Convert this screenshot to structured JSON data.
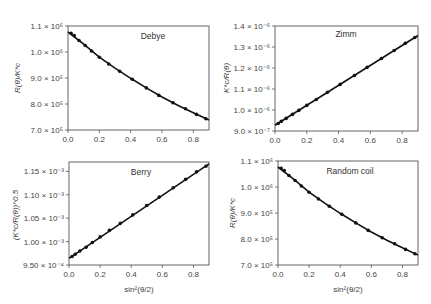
{
  "figure": {
    "shared_xlabel": "sin²(θ/2)"
  },
  "chart_data": [
    {
      "type": "line",
      "title": "Debye",
      "xlabel": "",
      "ylabel": "R(θ)/K*c",
      "xlim": [
        0.0,
        0.9
      ],
      "ylim": [
        700000,
        1100000
      ],
      "xticks": [
        0.0,
        0.2,
        0.4,
        0.6,
        0.8
      ],
      "xtick_labels": [
        "0.0",
        "0.2",
        "0.4",
        "0.6",
        "0.8"
      ],
      "yticks": [
        700000,
        800000,
        900000,
        1000000,
        1100000
      ],
      "ytick_labels": [
        "7.0 × 10⁵",
        "8.0 × 10⁵",
        "9.0 × 10⁵",
        "1.0 × 10⁶",
        "1.1 × 10⁶"
      ],
      "grid": false,
      "series": [
        {
          "name": "data points",
          "style": "markers",
          "x": [
            0.02,
            0.04,
            0.07,
            0.11,
            0.15,
            0.2,
            0.26,
            0.33,
            0.41,
            0.5,
            0.58,
            0.67,
            0.75,
            0.82,
            0.88
          ],
          "y": [
            1072000,
            1063000,
            1044000,
            1025000,
            1004000,
            980000,
            954000,
            926000,
            895000,
            862000,
            833000,
            805000,
            782000,
            760000,
            743000
          ]
        },
        {
          "name": "fit",
          "style": "line",
          "x": [
            0.0,
            0.1,
            0.2,
            0.3,
            0.4,
            0.5,
            0.6,
            0.7,
            0.8,
            0.9
          ],
          "y": [
            1077000,
            1030000,
            980000,
            938000,
            899000,
            862000,
            827000,
            795000,
            766000,
            738000
          ]
        }
      ]
    },
    {
      "type": "line",
      "title": "Zimm",
      "xlabel": "",
      "ylabel": "K*c/R(θ)",
      "xlim": [
        0.0,
        0.9
      ],
      "ylim": [
        9e-07,
        1.4e-06
      ],
      "xticks": [
        0.0,
        0.2,
        0.4,
        0.6,
        0.8
      ],
      "xtick_labels": [
        "0.0",
        "0.2",
        "0.4",
        "0.6",
        "0.8"
      ],
      "yticks": [
        9e-07,
        1e-06,
        1.1e-06,
        1.2e-06,
        1.3e-06,
        1.4e-06
      ],
      "ytick_labels": [
        "9.0 × 10⁻⁷",
        "1.0 × 10⁻⁶",
        "1.1 × 10⁻⁶",
        "1.2 × 10⁻⁶",
        "1.3 × 10⁻⁶",
        "1.4 × 10⁻⁶"
      ],
      "grid": false,
      "series": [
        {
          "name": "data points",
          "style": "markers",
          "x": [
            0.02,
            0.04,
            0.07,
            0.11,
            0.15,
            0.2,
            0.26,
            0.33,
            0.41,
            0.5,
            0.58,
            0.67,
            0.75,
            0.82,
            0.88
          ],
          "y": [
            9.36e-07,
            9.46e-07,
            9.6e-07,
            9.79e-07,
            9.98e-07,
            1.022e-06,
            1.05e-06,
            1.084e-06,
            1.122e-06,
            1.164e-06,
            1.203e-06,
            1.245e-06,
            1.283e-06,
            1.318e-06,
            1.345e-06
          ]
        },
        {
          "name": "fit",
          "style": "line",
          "x": [
            0.0,
            0.9
          ],
          "y": [
            9.27e-07,
            1.355e-06
          ]
        }
      ]
    },
    {
      "type": "line",
      "title": "Berry",
      "xlabel": "sin²(θ/2)",
      "ylabel": "(K*c/R(θ))^0.5",
      "xlim": [
        0.0,
        0.9
      ],
      "ylim": [
        0.00095,
        0.00117
      ],
      "xticks": [
        0.0,
        0.2,
        0.4,
        0.6,
        0.8
      ],
      "xtick_labels": [
        "0.0",
        "0.2",
        "0.4",
        "0.6",
        "0.8"
      ],
      "yticks": [
        0.00095,
        0.001,
        0.00105,
        0.0011,
        0.00115
      ],
      "ytick_labels": [
        "9.50 × 10⁻⁴",
        "1.00 × 10⁻³",
        "1.05 × 10⁻³",
        "1.10 × 10⁻³",
        "1.15 × 10⁻³"
      ],
      "grid": false,
      "series": [
        {
          "name": "data points",
          "style": "markers",
          "x": [
            0.02,
            0.04,
            0.07,
            0.11,
            0.15,
            0.2,
            0.26,
            0.33,
            0.41,
            0.5,
            0.58,
            0.67,
            0.75,
            0.82,
            0.88
          ],
          "y": [
            0.000968,
            0.000973,
            0.00098,
            0.000988,
            0.000998,
            0.00101,
            0.001024,
            0.001039,
            0.001057,
            0.001077,
            0.001095,
            0.001115,
            0.001133,
            0.001149,
            0.001161
          ]
        },
        {
          "name": "fit",
          "style": "line",
          "x": [
            0.0,
            0.9
          ],
          "y": [
            0.000964,
            0.001166
          ]
        }
      ]
    },
    {
      "type": "line",
      "title": "Random coil",
      "xlabel": "sin²(θ/2)",
      "ylabel": "R(θ)/K*c",
      "xlim": [
        0.0,
        0.9
      ],
      "ylim": [
        700000,
        1100000
      ],
      "xticks": [
        0.0,
        0.2,
        0.4,
        0.6,
        0.8
      ],
      "xtick_labels": [
        "0.0",
        "0.2",
        "0.4",
        "0.6",
        "0.8"
      ],
      "yticks": [
        700000,
        800000,
        900000,
        1000000,
        1100000
      ],
      "ytick_labels": [
        "7.0 × 10⁵",
        "8.0 × 10⁵",
        "9.0 × 10⁵",
        "1.0 × 10⁶",
        "1.1 × 10⁶"
      ],
      "grid": false,
      "series": [
        {
          "name": "data points",
          "style": "markers",
          "x": [
            0.02,
            0.04,
            0.07,
            0.11,
            0.15,
            0.2,
            0.26,
            0.33,
            0.41,
            0.5,
            0.58,
            0.67,
            0.75,
            0.82,
            0.88
          ],
          "y": [
            1072000,
            1063000,
            1044000,
            1025000,
            1004000,
            980000,
            954000,
            926000,
            895000,
            862000,
            833000,
            805000,
            782000,
            760000,
            743000
          ]
        },
        {
          "name": "fit",
          "style": "line",
          "x": [
            0.0,
            0.1,
            0.2,
            0.3,
            0.4,
            0.5,
            0.6,
            0.7,
            0.8,
            0.9
          ],
          "y": [
            1077000,
            1030000,
            980000,
            938000,
            899000,
            862000,
            827000,
            795000,
            766000,
            738000
          ]
        }
      ]
    }
  ]
}
